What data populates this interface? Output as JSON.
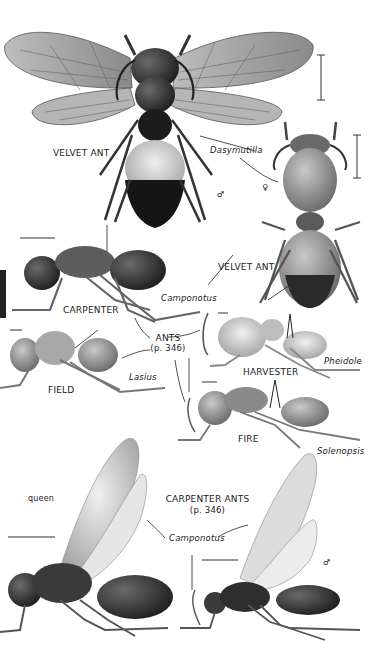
{
  "plate": {
    "labels": {
      "velvet_ant_top": "VELVET ANT",
      "dasymutilla": "Dasymutilla",
      "male_symbol_1": "♂",
      "female_symbol": "♀",
      "velvet_ant_mid": "VELVET ANT",
      "camponotus_1": "Camponotus",
      "carpenter": "CARPENTER",
      "ants": "ANTS",
      "ants_page": "(p. 346)",
      "field": "FIELD",
      "lasius": "Lasius",
      "harvester": "HARVESTER",
      "pheidole": "Pheidole",
      "fire": "FIRE",
      "solenopsis": "Solenopsis",
      "queen": "queen",
      "carpenter_ants": "CARPENTER ANTS",
      "carpenter_ants_page": "(p. 346)",
      "camponotus_2": "Camponotus",
      "male_symbol_2": "♂"
    },
    "illustrations": [
      "velvet-ant-male-winged",
      "velvet-ant-female-wingless",
      "carpenter-ant-worker",
      "field-ant-worker",
      "harvester-ant-worker",
      "fire-ant-worker",
      "carpenter-ant-queen-winged",
      "carpenter-ant-male-winged"
    ],
    "colors": {
      "background": "#ffffff",
      "ink": "#222222",
      "dark_body": "#1a1a1a",
      "mid_body": "#7a7a7a",
      "wing": "#d8d8d8"
    }
  }
}
